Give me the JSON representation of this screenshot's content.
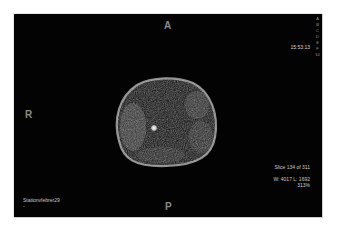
{
  "viewer": {
    "orientation": {
      "top": "A",
      "left": "R",
      "bottom": "P"
    },
    "time": "15:53:13",
    "slice_info": "Slice 134 of 311",
    "window_level": "W: 4017 L: 1692",
    "zoom": "313%",
    "station": "Stationvfebrer29",
    "station_sub": "-",
    "side_strip": [
      "A",
      "B",
      "C",
      "D",
      "E",
      "F",
      "10"
    ],
    "colors": {
      "background": "#030303",
      "overlay_text": "#c9c9c9",
      "orientation_text": "#8a8a8a"
    }
  }
}
